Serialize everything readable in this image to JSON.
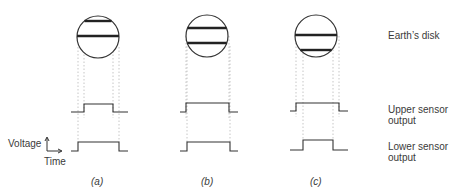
{
  "labels": {
    "earth_disk": "Earth’s disk",
    "upper_sensor_line1": "Upper sensor",
    "upper_sensor_line2": "output",
    "lower_sensor_line1": "Lower sensor",
    "lower_sensor_line2": "output",
    "voltage": "Voltage",
    "time": "Time"
  },
  "panels": [
    {
      "caption": "(a)",
      "disk": {
        "cx": 98,
        "cy": 37,
        "r": 21
      },
      "bands_y": [
        21,
        36
      ],
      "upper_pulse": {
        "x0": 71,
        "rise": 84,
        "fall": 113,
        "x1": 128,
        "low": 112,
        "high": 104
      },
      "lower_pulse": {
        "x0": 71,
        "rise": 78,
        "fall": 119,
        "x1": 128,
        "low": 151,
        "high": 142
      }
    },
    {
      "caption": "(b)",
      "disk": {
        "cx": 207,
        "cy": 36,
        "r": 21
      },
      "bands_y": [
        28,
        43
      ],
      "upper_pulse": {
        "x0": 180,
        "rise": 186,
        "fall": 229,
        "x1": 238,
        "low": 112,
        "high": 103
      },
      "lower_pulse": {
        "x0": 180,
        "rise": 187,
        "fall": 230,
        "x1": 238,
        "low": 151,
        "high": 142
      }
    },
    {
      "caption": "(c)",
      "disk": {
        "cx": 316,
        "cy": 36,
        "r": 21
      },
      "bands_y": [
        35,
        50
      ],
      "upper_pulse": {
        "x0": 290,
        "rise": 296,
        "fall": 339,
        "x1": 348,
        "low": 111,
        "high": 103
      },
      "lower_pulse": {
        "x0": 290,
        "rise": 303,
        "fall": 333,
        "x1": 348,
        "low": 150,
        "high": 140
      }
    }
  ],
  "colors": {
    "line": "#333333",
    "dotted": "#b8b8b8"
  }
}
